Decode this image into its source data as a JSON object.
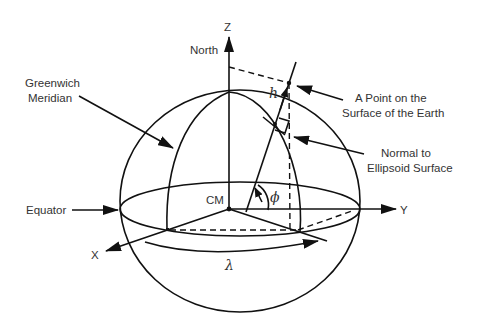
{
  "diagram": {
    "axes": {
      "z_label": "Z",
      "y_label": "Y",
      "x_label": "X"
    },
    "labels": {
      "north": "North",
      "greenwich_line1": "Greenwich",
      "greenwich_line2": "Meridian",
      "point_line1": "A Point on the",
      "point_line2": "Surface of the Earth",
      "normal_line1": "Normal to",
      "normal_line2": "Ellipsoid Surface",
      "equator": "Equator",
      "center_of_mass": "CM"
    },
    "symbols": {
      "height": "h",
      "latitude": "ϕ",
      "longitude": "λ"
    },
    "colors": {
      "stroke": "#111111",
      "text": "#333333",
      "background": "#ffffff"
    }
  }
}
